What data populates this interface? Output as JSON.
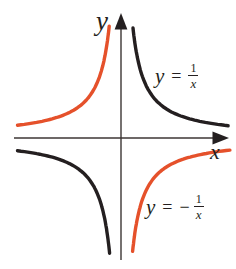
{
  "figure": {
    "axes": {
      "x_label": "x",
      "y_label": "y",
      "line_color": "#3c3634",
      "arrow_color": "#241f20"
    },
    "equation_labels": {
      "positive": {
        "lhs": "y",
        "equals": "=",
        "sign": "",
        "numerator": "1",
        "denominator": "x"
      },
      "negative": {
        "lhs": "y",
        "equals": "=",
        "sign": "−",
        "numerator": "1",
        "denominator": "x"
      }
    },
    "colors": {
      "background": "#ffffff",
      "curve_positive": "#241f20",
      "curve_negative": "#e5512b"
    }
  },
  "chart_data": {
    "type": "line",
    "title": "",
    "xlabel": "x",
    "ylabel": "y",
    "grid": false,
    "tick_labels": "none",
    "axis_ranges": {
      "x": [
        -3,
        3
      ],
      "y": [
        -3.4,
        3.4
      ]
    },
    "series": [
      {
        "name": "y = 1/x",
        "expression": "1/x",
        "coefficient": 1,
        "color": "#241f20",
        "quadrants": [
          "I",
          "III"
        ],
        "branches": [
          {
            "x_from": 0.33,
            "x_to": 2.95
          },
          {
            "x_from": -2.85,
            "x_to": -0.315
          }
        ]
      },
      {
        "name": "y = -1/x",
        "expression": "-1/x",
        "coefficient": -1,
        "color": "#e5512b",
        "quadrants": [
          "II",
          "IV"
        ],
        "branches": [
          {
            "x_from": -2.85,
            "x_to": -0.325
          },
          {
            "x_from": 0.32,
            "x_to": 3.0
          }
        ]
      }
    ]
  }
}
